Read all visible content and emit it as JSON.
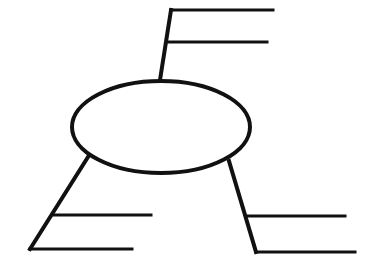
{
  "diagram": {
    "type": "spider-map",
    "title": "",
    "center": {
      "label": "",
      "cx": 161,
      "cy": 127,
      "rx": 89,
      "ry": 46
    },
    "branches": [
      {
        "name": "top",
        "stem": {
          "x1": 160,
          "y1": 80,
          "x2": 171,
          "y2": 10
        },
        "lines": [
          {
            "x1": 171,
            "y1": 10,
            "x2": 273,
            "y2": 10,
            "label": ""
          },
          {
            "x1": 168,
            "y1": 42,
            "x2": 267,
            "y2": 42,
            "label": ""
          }
        ]
      },
      {
        "name": "left",
        "stem": {
          "x1": 88,
          "y1": 157,
          "x2": 30,
          "y2": 249
        },
        "lines": [
          {
            "x1": 54,
            "y1": 215,
            "x2": 151,
            "y2": 215,
            "label": ""
          },
          {
            "x1": 30,
            "y1": 249,
            "x2": 132,
            "y2": 249,
            "label": ""
          }
        ]
      },
      {
        "name": "right",
        "stem": {
          "x1": 229,
          "y1": 161,
          "x2": 256,
          "y2": 252
        },
        "lines": [
          {
            "x1": 248,
            "y1": 216,
            "x2": 345,
            "y2": 216,
            "label": ""
          },
          {
            "x1": 256,
            "y1": 252,
            "x2": 355,
            "y2": 252,
            "label": ""
          }
        ]
      }
    ],
    "colors": {
      "stroke": "#111111",
      "background": "#ffffff"
    }
  }
}
